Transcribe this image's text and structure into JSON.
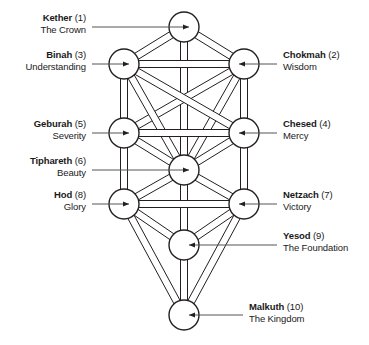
{
  "diagram": {
    "stroke_color": "#231f20",
    "leader_color": "#555555",
    "background": "#ffffff",
    "node_radius": 15,
    "path_width": 7,
    "nodes": [
      {
        "id": "kether",
        "name": "Kether",
        "number": "(1)",
        "subtitle": "The Crown",
        "cx": 184,
        "cy": 27,
        "side": "left"
      },
      {
        "id": "chokmah",
        "name": "Chokmah",
        "number": "(2)",
        "subtitle": "Wisdom",
        "cx": 244,
        "cy": 64,
        "side": "right"
      },
      {
        "id": "binah",
        "name": "Binah",
        "number": "(3)",
        "subtitle": "Understanding",
        "cx": 124,
        "cy": 64,
        "side": "left"
      },
      {
        "id": "chesed",
        "name": "Chesed",
        "number": "(4)",
        "subtitle": "Mercy",
        "cx": 244,
        "cy": 133,
        "side": "right"
      },
      {
        "id": "geburah",
        "name": "Geburah",
        "number": "(5)",
        "subtitle": "Severity",
        "cx": 124,
        "cy": 133,
        "side": "left"
      },
      {
        "id": "tiphareth",
        "name": "Tiphareth",
        "number": "(6)",
        "subtitle": "Beauty",
        "cx": 184,
        "cy": 170,
        "side": "left"
      },
      {
        "id": "netzach",
        "name": "Netzach",
        "number": "(7)",
        "subtitle": "Victory",
        "cx": 244,
        "cy": 204,
        "side": "right"
      },
      {
        "id": "hod",
        "name": "Hod",
        "number": "(8)",
        "subtitle": "Glory",
        "cx": 124,
        "cy": 204,
        "side": "left"
      },
      {
        "id": "yesod",
        "name": "Yesod",
        "number": "(9)",
        "subtitle": "The Foundation",
        "cx": 184,
        "cy": 245,
        "side": "right"
      },
      {
        "id": "malkuth",
        "name": "Malkuth",
        "number": "(10)",
        "subtitle": "The Kingdom",
        "cx": 184,
        "cy": 315,
        "side": "right"
      }
    ],
    "paths": [
      [
        "kether",
        "chokmah"
      ],
      [
        "kether",
        "binah"
      ],
      [
        "kether",
        "tiphareth"
      ],
      [
        "chokmah",
        "binah"
      ],
      [
        "chokmah",
        "chesed"
      ],
      [
        "chokmah",
        "tiphareth"
      ],
      [
        "chokmah",
        "geburah"
      ],
      [
        "binah",
        "geburah"
      ],
      [
        "binah",
        "tiphareth"
      ],
      [
        "binah",
        "chesed"
      ],
      [
        "chesed",
        "geburah"
      ],
      [
        "chesed",
        "tiphareth"
      ],
      [
        "chesed",
        "netzach"
      ],
      [
        "geburah",
        "tiphareth"
      ],
      [
        "geburah",
        "hod"
      ],
      [
        "tiphareth",
        "netzach"
      ],
      [
        "tiphareth",
        "hod"
      ],
      [
        "tiphareth",
        "yesod"
      ],
      [
        "tiphareth",
        "malkuth"
      ],
      [
        "netzach",
        "hod"
      ],
      [
        "netzach",
        "yesod"
      ],
      [
        "netzach",
        "malkuth"
      ],
      [
        "hod",
        "yesod"
      ],
      [
        "hod",
        "malkuth"
      ],
      [
        "yesod",
        "malkuth"
      ]
    ],
    "labels": {
      "kether": {
        "x": 8,
        "y": 12,
        "w": 78,
        "anchor": "left"
      },
      "binah": {
        "x": 0,
        "y": 49,
        "w": 86,
        "anchor": "left"
      },
      "geburah": {
        "x": 8,
        "y": 118,
        "w": 78,
        "anchor": "left"
      },
      "tiphareth": {
        "x": 2,
        "y": 155,
        "w": 84,
        "anchor": "left"
      },
      "hod": {
        "x": 8,
        "y": 189,
        "w": 78,
        "anchor": "left"
      },
      "chokmah": {
        "x": 283,
        "y": 49,
        "w": 86,
        "anchor": "right"
      },
      "chesed": {
        "x": 283,
        "y": 118,
        "w": 86,
        "anchor": "right"
      },
      "netzach": {
        "x": 283,
        "y": 189,
        "w": 86,
        "anchor": "right"
      },
      "yesod": {
        "x": 283,
        "y": 230,
        "w": 86,
        "anchor": "right"
      },
      "malkuth": {
        "x": 249,
        "y": 301,
        "w": 120,
        "anchor": "right"
      }
    },
    "leaders": [
      {
        "id": "kether",
        "x1": 92,
        "y1": 27,
        "x2": 189,
        "y2": 27,
        "arrow": "right"
      },
      {
        "id": "binah",
        "x1": 92,
        "y1": 64,
        "x2": 129,
        "y2": 64,
        "arrow": "right"
      },
      {
        "id": "geburah",
        "x1": 92,
        "y1": 133,
        "x2": 129,
        "y2": 133,
        "arrow": "right"
      },
      {
        "id": "tiphareth",
        "x1": 92,
        "y1": 170,
        "x2": 189,
        "y2": 170,
        "arrow": "right"
      },
      {
        "id": "hod",
        "x1": 92,
        "y1": 204,
        "x2": 129,
        "y2": 204,
        "arrow": "right"
      },
      {
        "id": "chokmah",
        "x1": 277,
        "y1": 64,
        "x2": 239,
        "y2": 64,
        "arrow": "left"
      },
      {
        "id": "chesed",
        "x1": 277,
        "y1": 133,
        "x2": 239,
        "y2": 133,
        "arrow": "left"
      },
      {
        "id": "netzach",
        "x1": 277,
        "y1": 204,
        "x2": 239,
        "y2": 204,
        "arrow": "left"
      },
      {
        "id": "yesod",
        "x1": 277,
        "y1": 245,
        "x2": 189,
        "y2": 245,
        "arrow": "left"
      },
      {
        "id": "malkuth",
        "x1": 243,
        "y1": 315,
        "x2": 189,
        "y2": 315,
        "arrow": "left"
      }
    ]
  }
}
